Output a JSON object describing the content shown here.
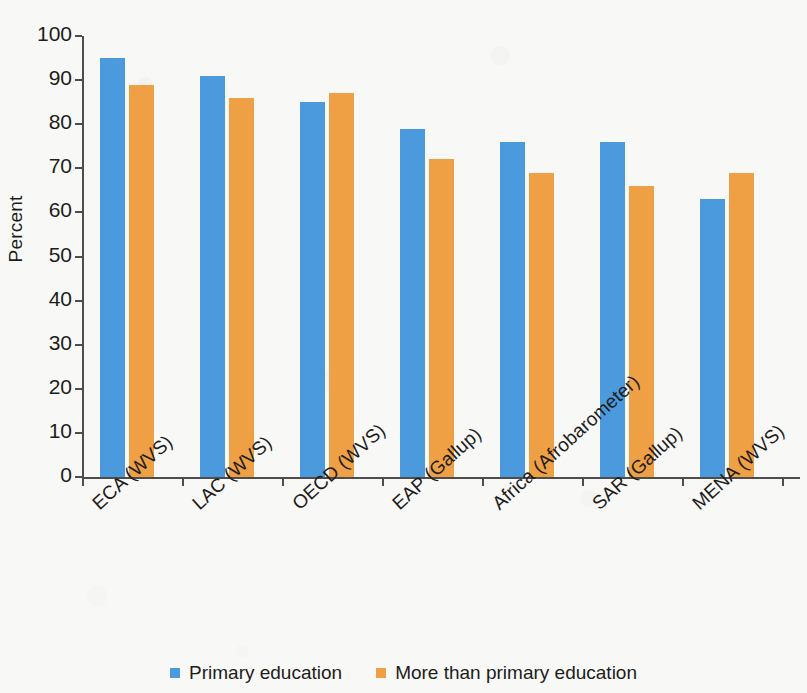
{
  "chart_data": {
    "type": "bar",
    "title": "",
    "xlabel": "",
    "ylabel": "Percent",
    "ylim": [
      0,
      100
    ],
    "ytick_step": 10,
    "grid": false,
    "legend_position": "bottom",
    "categories": [
      "ECA (WVS)",
      "LAC (WVS)",
      "OECD (WVS)",
      "EAP (Gallup)",
      "Africa (Afrobarometer)",
      "SAR (Gallup)",
      "MENA (WVS)"
    ],
    "ytick_labels": [
      "0",
      "10",
      "20",
      "30",
      "40",
      "50",
      "60",
      "70",
      "80",
      "90",
      "100"
    ],
    "series": [
      {
        "name": "Primary education",
        "color": "#4a9add",
        "values": [
          95,
          91,
          85,
          79,
          76,
          76,
          63
        ]
      },
      {
        "name": "More than primary education",
        "color": "#f0a044",
        "values": [
          89,
          86,
          87,
          72,
          69,
          66,
          69
        ]
      }
    ]
  },
  "figure": {
    "background_color": "#f8f8f6",
    "axis_color": "#4d4d4d",
    "text_color": "#1d1d1b"
  }
}
